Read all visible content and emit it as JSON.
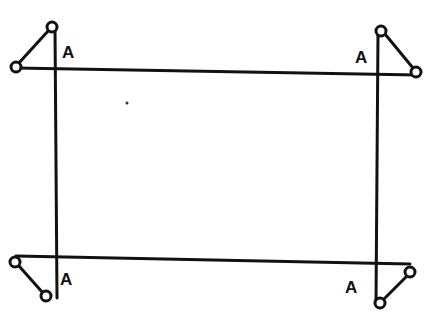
{
  "diagram": {
    "colors": {
      "ink": "#111111",
      "background": "#ffffff"
    },
    "labels": {
      "top_left": "A",
      "top_right": "A",
      "bottom_left": "A",
      "bottom_right": "A"
    }
  }
}
